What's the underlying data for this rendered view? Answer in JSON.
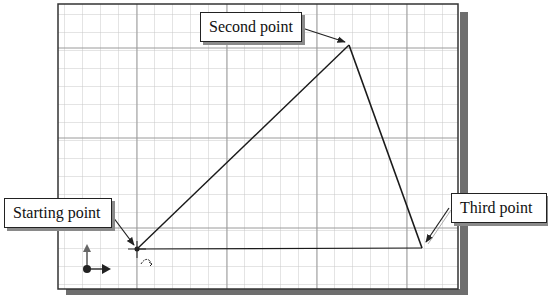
{
  "callouts": {
    "starting_point": "Starting point",
    "second_point": "Second point",
    "third_point": "Third point"
  },
  "sketch": {
    "points": {
      "start": [
        137,
        249
      ],
      "second": [
        349,
        45
      ],
      "third": [
        422,
        248
      ]
    },
    "grid": {
      "minor_spacing_px": 18,
      "major_every": 5
    },
    "colors": {
      "background": "#ffffff",
      "grid_minor": "#c8c8c8",
      "grid_major": "#9a9a9a",
      "frame": "#333333",
      "shadow": "#6e6e6e",
      "line": "#1a1a1a"
    }
  }
}
